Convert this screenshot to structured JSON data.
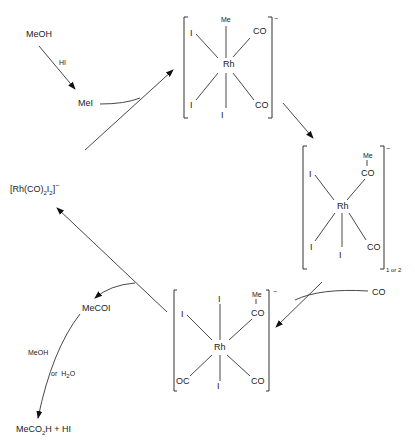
{
  "diagram": {
    "reactants": {
      "meoh": "MeOH",
      "hi": "HI",
      "mei": "MeI",
      "co": "CO"
    },
    "catalyst": {
      "prefix": "[Rh(CO)",
      "sub1": "2",
      "mid": "I",
      "sub2": "2",
      "suffix": "]",
      "charge": "−"
    },
    "complex_top": {
      "center": "Rh",
      "ligands": {
        "top": "Me",
        "upper_left": "I",
        "upper_right": "CO",
        "lower_left": "I",
        "bottom": "I",
        "lower_right": "CO"
      },
      "charge": "−"
    },
    "complex_right": {
      "center": "Rh",
      "ligands": {
        "acyl_me": "Me",
        "acyl_co": "CO",
        "upper_left": "I",
        "lower_left": "I",
        "bottom": "I",
        "lower_right": "CO"
      },
      "charge": "−",
      "subscript": "1 or 2"
    },
    "complex_bottom": {
      "center": "Rh",
      "ligands": {
        "top": "I",
        "acyl_me": "Me",
        "acyl_co": "CO",
        "upper_left": "I",
        "lower_left": "OC",
        "bottom": "I",
        "lower_right": "CO"
      },
      "charge": "−"
    },
    "products": {
      "acyl_iodide": "MeCOI",
      "hydrolysis_reagent_1": "MeOH",
      "hydrolysis_or": "or",
      "hydrolysis_reagent_2": "H",
      "hydrolysis_reagent_2_sub": "2",
      "hydrolysis_reagent_2_end": "O",
      "final_prefix": "MeCO",
      "final_sub": "2",
      "final_suffix": "H + HI"
    }
  }
}
